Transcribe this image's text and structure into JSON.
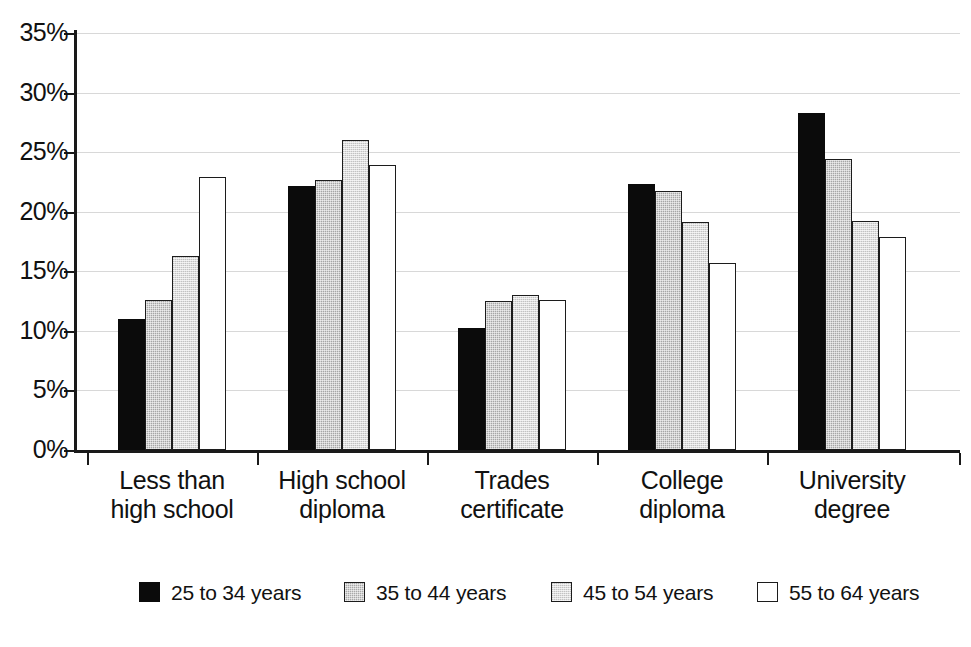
{
  "chart_data": {
    "type": "bar",
    "title": "",
    "subtitle": "",
    "xlabel": "",
    "ylabel": "",
    "grid": true,
    "legend_position": "bottom",
    "ylim": [
      0,
      35
    ],
    "ytick_values": [
      0,
      5,
      10,
      15,
      20,
      25,
      30,
      35
    ],
    "ytick_labels": [
      "0%",
      "5%",
      "10%",
      "15%",
      "20%",
      "25%",
      "30%",
      "35%"
    ],
    "categories": [
      "Less than high school",
      "High school diploma",
      "Trades certificate",
      "College diploma",
      "University degree"
    ],
    "category_lines": [
      [
        "Less than",
        "high school"
      ],
      [
        "High school",
        "diploma"
      ],
      [
        "Trades",
        "certificate"
      ],
      [
        "College",
        "diploma"
      ],
      [
        "University",
        "degree"
      ]
    ],
    "series": [
      {
        "name": "25 to 34 years",
        "color": "#0b0b0b",
        "values": [
          11.0,
          22.2,
          10.2,
          22.3,
          28.3
        ]
      },
      {
        "name": "35 to 44 years",
        "color": "#a6a6a6",
        "values": [
          12.6,
          22.7,
          12.5,
          21.7,
          24.4
        ]
      },
      {
        "name": "45 to 54 years",
        "color": "#dedede",
        "values": [
          16.3,
          26.0,
          13.0,
          19.1,
          19.2
        ]
      },
      {
        "name": "55 to 64 years",
        "color": "#ffffff",
        "values": [
          22.9,
          23.9,
          12.6,
          15.7,
          17.9
        ]
      }
    ]
  },
  "legend": {
    "items": [
      {
        "label": "25 to 34 years"
      },
      {
        "label": "35 to 44 years"
      },
      {
        "label": "45 to 54 years"
      },
      {
        "label": "55 to 64 years"
      }
    ]
  }
}
